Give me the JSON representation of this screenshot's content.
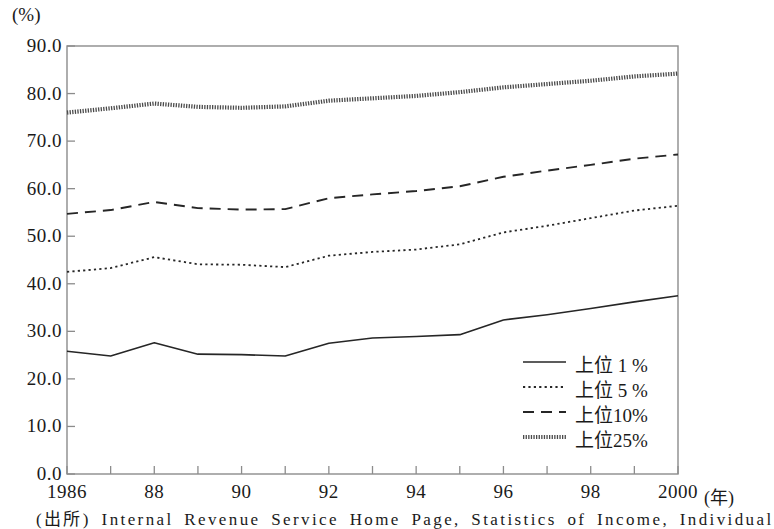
{
  "chart_data": {
    "type": "line",
    "title": "",
    "xlabel": "(年)",
    "ylabel": "(%)",
    "x": [
      1986,
      1987,
      1988,
      1989,
      1990,
      1991,
      1992,
      1993,
      1994,
      1995,
      1996,
      1997,
      1998,
      1999,
      2000
    ],
    "xtick_labels": [
      "1986",
      "",
      "88",
      "",
      "90",
      "",
      "92",
      "",
      "94",
      "",
      "96",
      "",
      "98",
      "",
      "2000"
    ],
    "ytick_labels": [
      "0.0",
      "10.0",
      "20.0",
      "30.0",
      "40.0",
      "50.0",
      "60.0",
      "70.0",
      "80.0",
      "90.0"
    ],
    "ylim": [
      0.0,
      90.0
    ],
    "ytick_step": 10.0,
    "xlim": [
      1986,
      2000
    ],
    "grid": false,
    "legend_position": "lower-right-inside",
    "series": [
      {
        "name": "上位1%",
        "style": "solid",
        "color": "#262626",
        "values": [
          25.8,
          24.8,
          27.6,
          25.2,
          25.1,
          24.8,
          27.5,
          28.6,
          28.9,
          29.3,
          32.4,
          33.5,
          34.8,
          36.2,
          37.5
        ]
      },
      {
        "name": "上位5%",
        "style": "dotted",
        "color": "#262626",
        "values": [
          42.5,
          43.3,
          45.6,
          44.1,
          44.0,
          43.5,
          45.9,
          46.7,
          47.2,
          48.3,
          50.8,
          52.2,
          53.8,
          55.4,
          56.4
        ]
      },
      {
        "name": "上位10%",
        "style": "dashed",
        "color": "#262626",
        "values": [
          54.7,
          55.5,
          57.2,
          55.9,
          55.6,
          55.7,
          58.0,
          58.8,
          59.5,
          60.5,
          62.5,
          63.8,
          65.0,
          66.3,
          67.2
        ]
      },
      {
        "name": "上位25%",
        "style": "thick",
        "color": "#4a4a4a",
        "values": [
          76.0,
          76.9,
          77.9,
          77.2,
          77.0,
          77.3,
          78.5,
          79.0,
          79.5,
          80.3,
          81.3,
          82.0,
          82.7,
          83.6,
          84.2
        ]
      }
    ]
  },
  "axes": {
    "y_unit": "(%)",
    "x_unit": "(年)"
  },
  "legend": {
    "items": [
      {
        "label": "上位 1 %",
        "style": "solid"
      },
      {
        "label": "上位 5 %",
        "style": "dotted"
      },
      {
        "label": "上位10%",
        "style": "dashed"
      },
      {
        "label": "上位25%",
        "style": "thick"
      }
    ]
  },
  "footer": {
    "source": "(出所) Internal Revenue Service Home Page, Statistics of Income, Individual"
  }
}
